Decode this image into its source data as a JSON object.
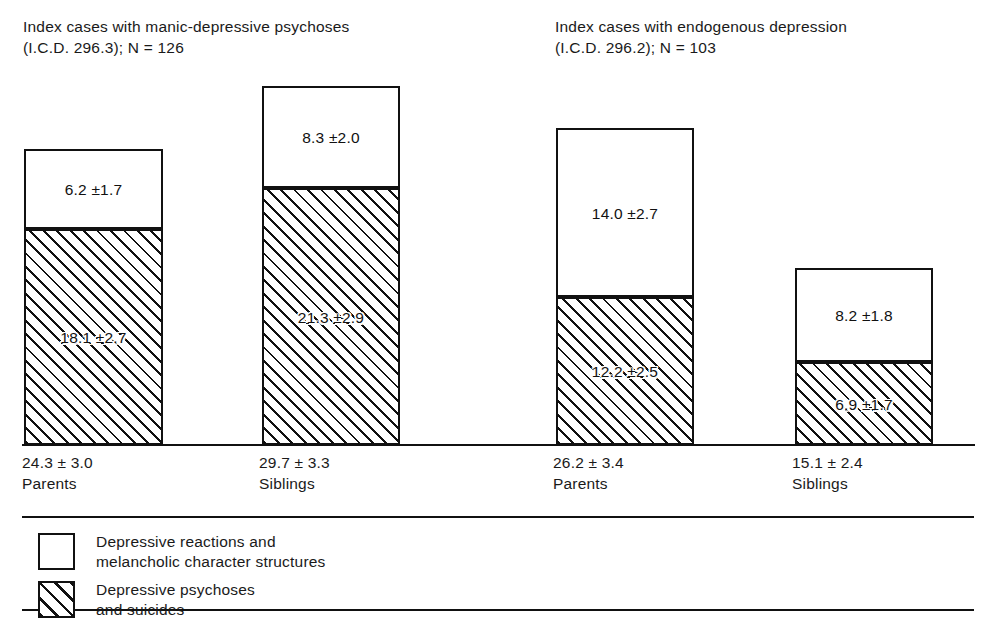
{
  "headers": {
    "left": "Index cases with manic-depressive psychoses\n(I.C.D. 296.3); N = 126",
    "right": "Index cases with endogenous depression\n(I.C.D. 296.2); N = 103"
  },
  "legend": {
    "items": [
      {
        "pattern": "white",
        "label": "Depressive reactions and\nmelancholic character structures"
      },
      {
        "pattern": "hatch",
        "label": "Depressive psychoses\nand suicides"
      }
    ]
  },
  "chart_data": {
    "type": "bar",
    "xlabel": "",
    "ylabel": "",
    "stacked": true,
    "grid": false,
    "legend_position": "bottom",
    "ylim": [
      0,
      32
    ],
    "units": "percent risk",
    "groups": [
      {
        "name": "Index cases with manic-depressive psychoses (I.C.D. 296.3); N = 126",
        "categories": [
          "Parents",
          "Siblings"
        ]
      },
      {
        "name": "Index cases with endogenous depression (I.C.D. 296.2); N = 103",
        "categories": [
          "Parents",
          "Siblings"
        ]
      }
    ],
    "series": [
      {
        "name": "Depressive reactions and melancholic character structures",
        "pattern": "white",
        "values": [
          6.2,
          8.3,
          14.0,
          8.2
        ],
        "errors": [
          1.7,
          2.0,
          2.7,
          1.8
        ]
      },
      {
        "name": "Depressive psychoses and suicides",
        "pattern": "hatch",
        "values": [
          18.1,
          21.3,
          12.2,
          6.9
        ],
        "errors": [
          2.7,
          2.9,
          2.5,
          1.7
        ]
      }
    ],
    "bars": [
      {
        "group": 0,
        "category": "Parents",
        "total_label": "24.3 ± 3.0",
        "category_label": "Parents",
        "total": 24.3,
        "total_error": 3.0,
        "top": {
          "label": "6.2 ±1.7",
          "value": 6.2,
          "error": 1.7,
          "pattern": "white"
        },
        "bottom": {
          "label": "18.1 ±2.7",
          "value": 18.1,
          "error": 2.7,
          "pattern": "hatch"
        },
        "geom": {
          "left": 24,
          "width": 139,
          "top": 149,
          "divider": 229,
          "base": 445
        },
        "label_pos": {
          "left": 22,
          "top": 452
        }
      },
      {
        "group": 0,
        "category": "Siblings",
        "total_label": "29.7 ± 3.3",
        "category_label": "Siblings",
        "total": 29.7,
        "total_error": 3.3,
        "top": {
          "label": "8.3 ±2.0",
          "value": 8.3,
          "error": 2.0,
          "pattern": "white"
        },
        "bottom": {
          "label": "21.3 ±2.9",
          "value": 21.3,
          "error": 2.9,
          "pattern": "hatch"
        },
        "geom": {
          "left": 262,
          "width": 138,
          "top": 86,
          "divider": 188,
          "base": 445
        },
        "label_pos": {
          "left": 259,
          "top": 452
        }
      },
      {
        "group": 1,
        "category": "Parents",
        "total_label": "26.2 ± 3.4",
        "category_label": "Parents",
        "total": 26.2,
        "total_error": 3.4,
        "top": {
          "label": "14.0 ±2.7",
          "value": 14.0,
          "error": 2.7,
          "pattern": "white"
        },
        "bottom": {
          "label": "12.2 ±2.5",
          "value": 12.2,
          "error": 2.5,
          "pattern": "hatch"
        },
        "geom": {
          "left": 556,
          "width": 138,
          "top": 128,
          "divider": 297,
          "base": 445
        },
        "label_pos": {
          "left": 553,
          "top": 452
        }
      },
      {
        "group": 1,
        "category": "Siblings",
        "total_label": "15.1 ± 2.4",
        "category_label": "Siblings",
        "total": 15.1,
        "total_error": 2.4,
        "top": {
          "label": "8.2 ±1.8",
          "value": 8.2,
          "error": 1.8,
          "pattern": "white"
        },
        "bottom": {
          "label": "6.9 ±1.7",
          "value": 6.9,
          "error": 1.7,
          "pattern": "hatch"
        },
        "geom": {
          "left": 795,
          "width": 138,
          "top": 268,
          "divider": 362,
          "base": 445
        },
        "label_pos": {
          "left": 792,
          "top": 452
        }
      }
    ]
  }
}
